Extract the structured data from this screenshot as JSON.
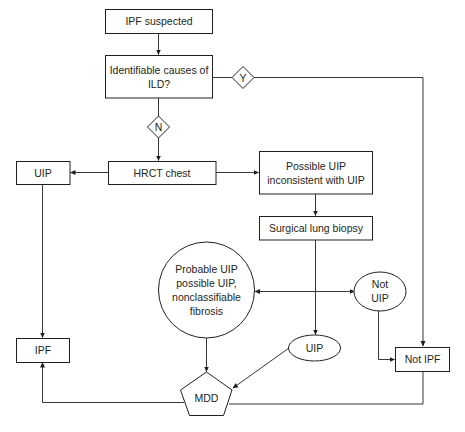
{
  "diagram": {
    "type": "flowchart",
    "colors": {
      "stroke": "#231f20",
      "background": "#ffffff",
      "text": "#231f20"
    },
    "nodes": {
      "ipf_suspected": {
        "label": "IPF suspected",
        "shape": "rect"
      },
      "identifiable_causes": {
        "label_lines": [
          "Identifiable causes of",
          "ILD?"
        ],
        "shape": "rect"
      },
      "decision_yes": {
        "label": "Y",
        "shape": "diamond"
      },
      "decision_no": {
        "label": "N",
        "shape": "diamond"
      },
      "hrct_chest": {
        "label": "HRCT chest",
        "shape": "rect"
      },
      "uip_hrct": {
        "label": "UIP",
        "shape": "rect"
      },
      "possible_uip": {
        "label_lines": [
          "Possible UIP",
          "inconsistent with UIP"
        ],
        "shape": "rect"
      },
      "surgical_biopsy": {
        "label": "Surgical lung biopsy",
        "shape": "rect"
      },
      "probable_uip": {
        "label_lines": [
          "Probable UIP",
          "possible UIP,",
          "nonclassifiable",
          "fibrosis"
        ],
        "shape": "circle"
      },
      "not_uip": {
        "label_lines": [
          "Not",
          "UIP"
        ],
        "shape": "ellipse"
      },
      "uip_biopsy": {
        "label": "UIP",
        "shape": "ellipse"
      },
      "ipf": {
        "label": "IPF",
        "shape": "rect"
      },
      "not_ipf": {
        "label": "Not IPF",
        "shape": "rect"
      },
      "mdd": {
        "label": "MDD",
        "shape": "pentagon"
      }
    },
    "edges": [
      {
        "from": "IPF suspected",
        "to": "Identifiable causes of ILD?"
      },
      {
        "from": "Identifiable causes of ILD?",
        "to": "Not IPF",
        "via": "Y"
      },
      {
        "from": "Identifiable causes of ILD?",
        "to": "HRCT chest",
        "via": "N"
      },
      {
        "from": "HRCT chest",
        "to": "UIP"
      },
      {
        "from": "HRCT chest",
        "to": "Possible UIP inconsistent with UIP"
      },
      {
        "from": "UIP",
        "to": "IPF"
      },
      {
        "from": "Possible UIP inconsistent with UIP",
        "to": "Surgical lung biopsy"
      },
      {
        "from": "Surgical lung biopsy",
        "to": "UIP (biopsy)"
      },
      {
        "from": "Probable UIP possible UIP, nonclassifiable fibrosis",
        "to": "Not UIP",
        "bidirectional": true
      },
      {
        "from": "Probable UIP possible UIP, nonclassifiable fibrosis",
        "to": "MDD"
      },
      {
        "from": "UIP (biopsy)",
        "to": "MDD"
      },
      {
        "from": "Not UIP",
        "to": "Not IPF"
      },
      {
        "from": "MDD",
        "to": "IPF"
      },
      {
        "from": "MDD",
        "to": "Not IPF"
      }
    ]
  }
}
